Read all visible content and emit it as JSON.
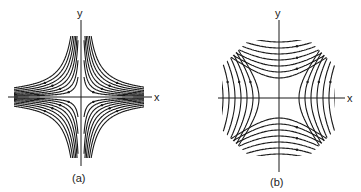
{
  "figure": {
    "panels": [
      {
        "id": "a",
        "caption": "(a)",
        "x_label": "x",
        "y_label": "y",
        "description": "Rectangular hyperbola streamlines xy = const (saddle, curves approaching axes)",
        "stroke_color": "#1a1a1a"
      },
      {
        "id": "b",
        "caption": "(b)",
        "x_label": "x",
        "y_label": "y",
        "description": "Hyperbola streamlines x^2 - y^2 = const (axes-rotated saddle)",
        "stroke_color": "#1a1a1a"
      }
    ]
  }
}
